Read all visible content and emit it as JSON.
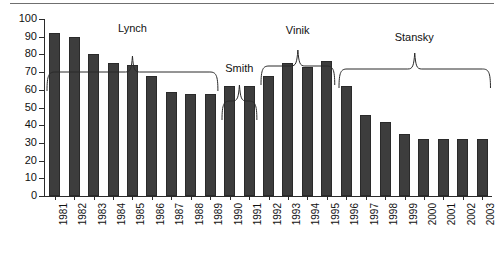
{
  "chart_data": {
    "type": "bar",
    "title": "",
    "subtitle": "",
    "xlabel": "",
    "ylabel": "",
    "ylim": [
      0,
      100
    ],
    "ytick_step": 10,
    "grid": false,
    "legend": "none",
    "bar_color": "#3d3d3d",
    "axis_color": "#2b2b2b",
    "categories": [
      "1981",
      "1982",
      "1983",
      "1984",
      "1985",
      "1986",
      "1987",
      "1988",
      "1989",
      "1990",
      "1991",
      "1992",
      "1993",
      "1994",
      "1995",
      "1996",
      "1997",
      "1998",
      "1999",
      "2000",
      "2001",
      "2002",
      "2003"
    ],
    "values": [
      92,
      90,
      80,
      75,
      74,
      68,
      59,
      57.5,
      57.5,
      62,
      62,
      68,
      75,
      73,
      76.5,
      62,
      46,
      42,
      35,
      32,
      32,
      32,
      32
    ],
    "ytick_labels": [
      "100",
      "90",
      "80",
      "70",
      "60",
      "50",
      "40",
      "30",
      "20",
      "10",
      "0"
    ],
    "ytick_values": [
      100,
      90,
      80,
      70,
      60,
      50,
      40,
      30,
      20,
      10,
      0
    ],
    "annotations": [
      {
        "label": "Lynch",
        "start_category": "1981",
        "end_category": "1989",
        "type": "bracket"
      },
      {
        "label": "Smith",
        "start_category": "1990",
        "end_category": "1991",
        "type": "bracket"
      },
      {
        "label": "Vinik",
        "start_category": "1992",
        "end_category": "1995",
        "type": "bracket"
      },
      {
        "label": "Stansky",
        "start_category": "1996",
        "end_category": "2003",
        "type": "bracket"
      }
    ]
  }
}
